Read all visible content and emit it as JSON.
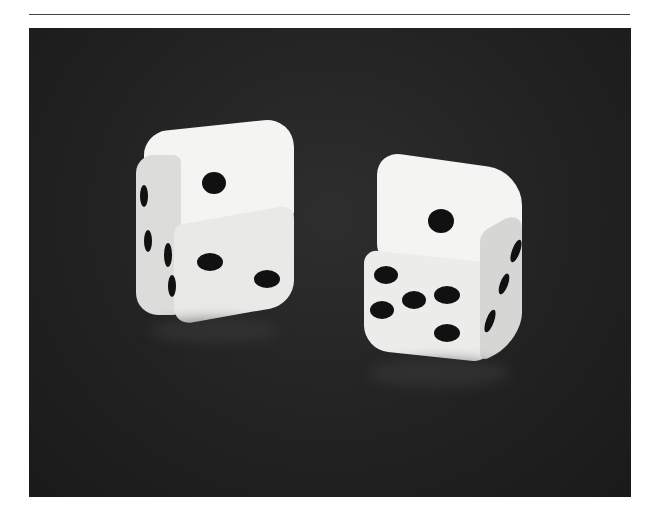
{
  "page": {
    "has_top_rule": true
  },
  "photo": {
    "subject": "two white dice on dark reflective surface",
    "background_color": "#222222",
    "dice": [
      {
        "id": "left-die",
        "top_face": 1,
        "front_face": 2,
        "side_face": 3
      },
      {
        "id": "right-die",
        "top_face": 1,
        "front_face": 5,
        "side_face": 3
      }
    ]
  }
}
